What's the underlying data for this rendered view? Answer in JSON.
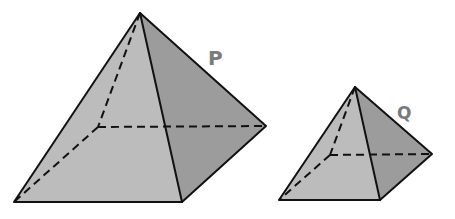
{
  "diagram": {
    "type": "square-pyramids",
    "colors": {
      "front_face": "#bcbcbc",
      "right_face": "#9c9c9c",
      "edge": "#111111",
      "label": "#7a7a7a",
      "background": "#ffffff"
    },
    "shapes": [
      {
        "id": "P",
        "label": "P",
        "apex": [
          140,
          13
        ],
        "base": {
          "front_left": [
            14,
            202
          ],
          "front_right": [
            182,
            202
          ],
          "back_right": [
            266,
            126
          ],
          "back_left_hidden": [
            98,
            127
          ]
        },
        "label_position": [
          214,
          65
        ]
      },
      {
        "id": "Q",
        "label": "Q",
        "apex": [
          355,
          87
        ],
        "base": {
          "front_left": [
            279,
            200
          ],
          "front_right": [
            380,
            200
          ],
          "back_right": [
            432,
            154
          ],
          "back_left_hidden": [
            330,
            155
          ]
        },
        "label_position": [
          404,
          119
        ]
      }
    ]
  }
}
